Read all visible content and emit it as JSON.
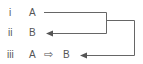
{
  "rows": [
    {
      "numeral": "i",
      "content": "A"
    },
    {
      "numeral": "ii",
      "content": "B"
    },
    {
      "numeral": "iii",
      "content_left": "A",
      "implies_symbol": "⇨",
      "content_right": "B"
    }
  ],
  "colors": {
    "text": "#555555",
    "line": "#666666"
  }
}
